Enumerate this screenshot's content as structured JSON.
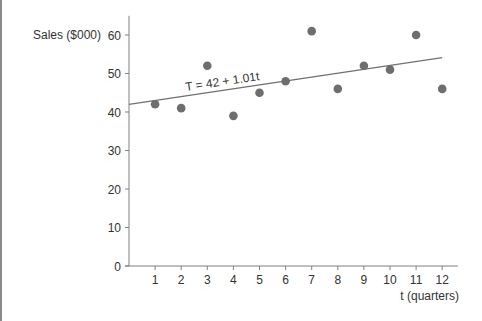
{
  "chart_data": {
    "type": "scatter",
    "title": "",
    "xlabel": "t (quarters)",
    "ylabel": "Sales ($000)",
    "x": [
      1,
      2,
      3,
      4,
      5,
      6,
      7,
      8,
      9,
      10,
      11,
      12
    ],
    "series": [
      {
        "name": "Sales",
        "values": [
          42,
          41,
          52,
          39,
          45,
          48,
          61,
          46,
          52,
          51,
          60,
          46
        ]
      }
    ],
    "trend_line": {
      "label": "T = 42 + 1.01t",
      "intercept": 42,
      "slope": 1.01,
      "x_range": [
        0,
        12
      ]
    },
    "x_ticks": [
      "1",
      "2",
      "3",
      "4",
      "5",
      "6",
      "7",
      "8",
      "9",
      "10",
      "11",
      "12"
    ],
    "y_ticks": [
      "0",
      "10",
      "20",
      "30",
      "40",
      "50",
      "60"
    ],
    "xlim": [
      0,
      12.6
    ],
    "ylim": [
      0,
      65
    ],
    "grid": false,
    "legend": "none",
    "colors": {
      "points": "#6e6e6e",
      "line": "#707070",
      "axis": "#808080",
      "text": "#333333"
    }
  }
}
